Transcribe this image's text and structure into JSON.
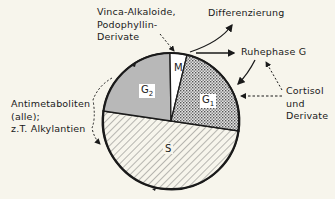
{
  "diagram": {
    "phases": [
      {
        "id": "M",
        "label": "M",
        "fill": "white"
      },
      {
        "id": "G1",
        "label": "G",
        "subscript": "1",
        "fill": "dotted"
      },
      {
        "id": "S",
        "label": "S",
        "fill": "hatched"
      },
      {
        "id": "G2",
        "label": "G",
        "subscript": "2",
        "fill": "gray"
      }
    ],
    "annotations": {
      "vinca": [
        "Vinca-Alkaloide,",
        "Podophyllin-",
        "Derivate"
      ],
      "differenzierung": "Differenzierung",
      "ruhephase": "Ruhephase G",
      "cortisol": [
        "Cortisol",
        "und",
        "Derivate"
      ],
      "antimetaboliten": [
        "Antimetaboliten",
        "(alle);",
        "z.T. Alkylantien"
      ]
    },
    "colors": {
      "background": "#f7f5ec",
      "line": "#1a1a1a",
      "g2_fill": "#b8b8b8",
      "g1_fill": "#d9d9d9"
    }
  }
}
